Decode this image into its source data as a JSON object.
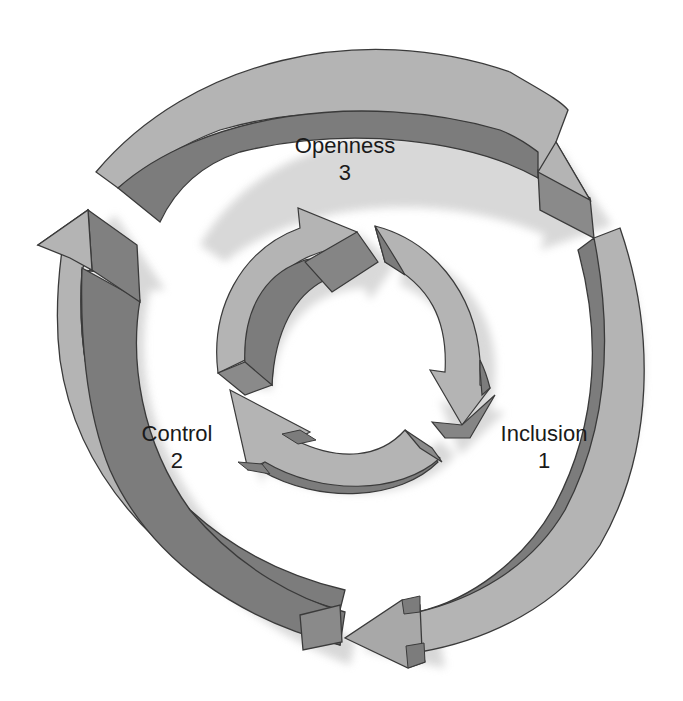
{
  "diagram": {
    "type": "cycle",
    "colors": {
      "background": "#ffffff",
      "arrow_light_face": "#b4b4b4",
      "arrow_dark_face": "#7c7c7c",
      "arrow_end_face": "#8a8a8a",
      "shadow": "#d6d6d6",
      "outline": "#3a3a3a",
      "label_text": "#1a1a1a"
    },
    "stages": [
      {
        "name": "Openness",
        "number": "3",
        "position": "top"
      },
      {
        "name": "Control",
        "number": "2",
        "position": "left"
      },
      {
        "name": "Inclusion",
        "number": "1",
        "position": "right"
      }
    ],
    "outer_cycle": {
      "arrow_count": 3,
      "direction": "clockwise"
    },
    "inner_cycle": {
      "arrow_count": 3,
      "direction": "clockwise"
    }
  }
}
